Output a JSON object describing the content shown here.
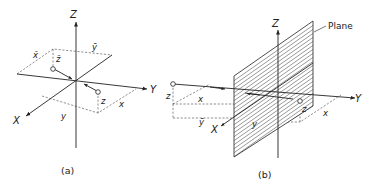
{
  "figure_a": {
    "caption": "(a)",
    "axes": {
      "x": "X",
      "y": "Y",
      "z": "Z"
    },
    "labels": {
      "x_bar": "x̄",
      "y_bar": "ȳ",
      "z_bar": "z̄",
      "x": "x",
      "y": "y",
      "z": "z"
    },
    "description": "Inversion of a point through the origin"
  },
  "figure_b": {
    "caption": "(b)",
    "axes": {
      "x": "X",
      "y": "Y",
      "z": "Z"
    },
    "labels": {
      "x": "x",
      "y_bar": "ȳ",
      "y": "y",
      "z_left": "z",
      "z_right": "z",
      "x_right": "x"
    },
    "plane_label": "Plane",
    "description": "Reflection of a point through a plane"
  }
}
